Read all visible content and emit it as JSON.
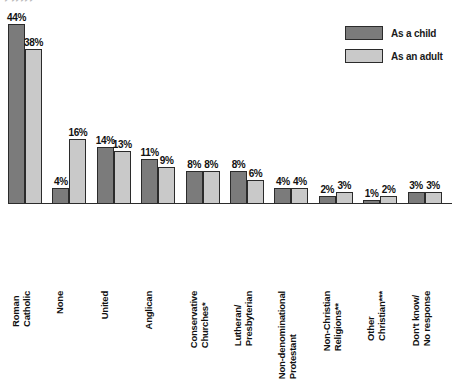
{
  "top_artifact": "‣ ‣‣‣‣‣",
  "legend": {
    "items": [
      {
        "label": "As a child",
        "color": "#7b7b7b",
        "key": "child"
      },
      {
        "label": "As an adult",
        "color": "#c9c9c9",
        "key": "adult"
      }
    ]
  },
  "chart_data": {
    "type": "bar",
    "title": "",
    "xlabel": "",
    "ylabel": "",
    "ylim": [
      0,
      48
    ],
    "grid": false,
    "legend_position": "top-right",
    "value_suffix": "%",
    "categories": [
      "Roman Catholic",
      "None",
      "United",
      "Anglican",
      "Conservative Churches*",
      "Lutheran/ Presbyterian",
      "Non-denominational Protestant",
      "Non-Christian Religions**",
      "Other Christian***",
      "Don't know/ No response"
    ],
    "category_lines": [
      [
        "Roman",
        "Catholic"
      ],
      [
        "None",
        ""
      ],
      [
        "United",
        ""
      ],
      [
        "Anglican",
        ""
      ],
      [
        "Conservative",
        "Churches*"
      ],
      [
        "Lutheran/",
        "Presbyterian"
      ],
      [
        "Non-denominational",
        "Protestant"
      ],
      [
        "Non-Christian",
        "Religions**"
      ],
      [
        "Other",
        "Christian***"
      ],
      [
        "Don't know/",
        "No response"
      ]
    ],
    "series": [
      {
        "name": "As a child",
        "color": "#7b7b7b",
        "values": [
          44,
          4,
          14,
          11,
          8,
          8,
          4,
          2,
          1,
          3
        ],
        "labels": [
          "44%",
          "4%",
          "14%",
          "11%",
          "8%",
          "8%",
          "4%",
          "2%",
          "1%",
          "3%"
        ]
      },
      {
        "name": "As an adult",
        "color": "#c9c9c9",
        "values": [
          38,
          16,
          13,
          9,
          8,
          6,
          4,
          3,
          2,
          3
        ],
        "labels": [
          "38%",
          "16%",
          "13%",
          "9%",
          "8%",
          "6%",
          "4%",
          "3%",
          "2%",
          "3%"
        ]
      }
    ]
  }
}
